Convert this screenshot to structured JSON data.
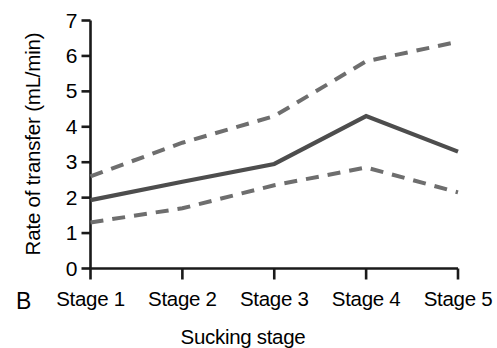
{
  "panel": {
    "label": "B"
  },
  "chart_data": {
    "type": "line",
    "title": "",
    "xlabel": "Sucking stage",
    "ylabel": "Rate of transfer (mL/min)",
    "categories": [
      "Stage 1",
      "Stage 2",
      "Stage 3",
      "Stage 4",
      "Stage 5"
    ],
    "series": [
      {
        "name": "Upper confidence limit",
        "style": "dashed",
        "color": "#6e6e6e",
        "values": [
          2.6,
          3.55,
          4.3,
          5.85,
          6.4
        ]
      },
      {
        "name": "Mean rate of transfer",
        "style": "solid",
        "color": "#4d4d4d",
        "values": [
          1.93,
          2.45,
          2.95,
          4.3,
          3.3
        ]
      },
      {
        "name": "Lower confidence limit",
        "style": "dashed",
        "color": "#6e6e6e",
        "values": [
          1.3,
          1.7,
          2.35,
          2.85,
          2.15
        ]
      }
    ],
    "ylim": [
      0,
      7
    ],
    "yticks": [
      0,
      1,
      2,
      3,
      4,
      5,
      6,
      7
    ],
    "ytick_labels": [
      "0",
      "1",
      "2",
      "3",
      "4",
      "5",
      "6",
      "7"
    ],
    "grid": false,
    "legend": "none",
    "axis_color": "#1a1a1a"
  }
}
